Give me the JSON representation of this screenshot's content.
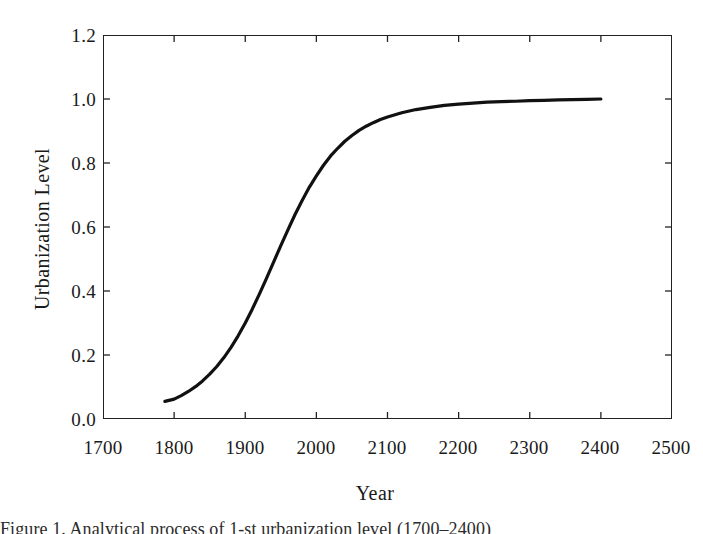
{
  "figure": {
    "caption": "Figure 1. Analytical process of 1-st urbanization level (1700–2400)"
  },
  "chart_data": {
    "type": "line",
    "title": "",
    "xlabel": "Year",
    "ylabel": "Urbanization Level",
    "xlim": [
      1700,
      2500
    ],
    "ylim": [
      0.0,
      1.2
    ],
    "xticks": [
      1700,
      1800,
      1900,
      2000,
      2100,
      2200,
      2300,
      2400,
      2500
    ],
    "xtick_labels": [
      "1700",
      "1800",
      "1900",
      "2000",
      "2100",
      "2200",
      "2300",
      "2400",
      "2500"
    ],
    "yticks": [
      0.0,
      0.2,
      0.4,
      0.6,
      0.8,
      1.0,
      1.2
    ],
    "ytick_labels": [
      "0.0",
      "0.2",
      "0.4",
      "0.6",
      "0.8",
      "1.0",
      "1.2"
    ],
    "grid": false,
    "legend": false,
    "line_color": "#111111",
    "line_width": 3.2,
    "series": [
      {
        "name": "Urbanization Level",
        "x": [
          1787,
          1800,
          1810,
          1820,
          1830,
          1840,
          1850,
          1860,
          1870,
          1880,
          1890,
          1900,
          1910,
          1920,
          1930,
          1940,
          1950,
          1960,
          1970,
          1980,
          1990,
          2000,
          2010,
          2020,
          2030,
          2040,
          2050,
          2060,
          2070,
          2080,
          2090,
          2100,
          2120,
          2140,
          2160,
          2180,
          2200,
          2220,
          2240,
          2260,
          2280,
          2300,
          2320,
          2340,
          2360,
          2380,
          2400
        ],
        "values": [
          0.055,
          0.062,
          0.073,
          0.086,
          0.101,
          0.119,
          0.14,
          0.164,
          0.192,
          0.224,
          0.26,
          0.3,
          0.344,
          0.391,
          0.44,
          0.491,
          0.542,
          0.591,
          0.639,
          0.683,
          0.724,
          0.76,
          0.793,
          0.822,
          0.846,
          0.868,
          0.886,
          0.902,
          0.915,
          0.926,
          0.936,
          0.944,
          0.957,
          0.967,
          0.974,
          0.98,
          0.984,
          0.987,
          0.99,
          0.992,
          0.993,
          0.995,
          0.996,
          0.997,
          0.998,
          0.999,
          1.0
        ]
      }
    ]
  }
}
